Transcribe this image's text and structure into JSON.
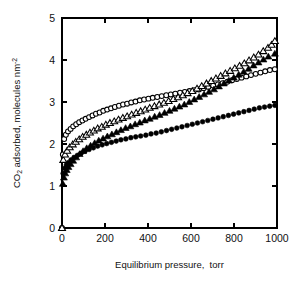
{
  "chart_data": {
    "type": "scatter",
    "title": "",
    "xlabel": "Equilibrium pressure,  torr",
    "ylabel": "CO2 adsorbed, molecules nm-2",
    "ylabel_parts": {
      "prefix": "CO",
      "subscript": "2",
      "middle": " adsorbed, molecules nm",
      "superscript": "-2"
    },
    "xlabel_parts": {
      "main": "Equilibrium pressure,",
      "unit": "torr"
    },
    "xlim": [
      0,
      1000
    ],
    "ylim": [
      0,
      5
    ],
    "xticks": [
      0,
      200,
      400,
      600,
      800,
      1000
    ],
    "yticks": [
      0,
      1,
      2,
      3,
      4,
      5
    ],
    "xtick_labels": [
      "0",
      "200",
      "400",
      "600",
      "800",
      "1000"
    ],
    "ytick_labels": [
      "0",
      "1",
      "2",
      "3",
      "4",
      "5"
    ],
    "grid": false,
    "legend": "none",
    "tick_direction": "in",
    "frame": [
      "left",
      "bottom",
      "top",
      "right"
    ],
    "series": [
      {
        "name": "open-circles",
        "marker": "circle-open",
        "color": "#000000",
        "points": [
          [
            0,
            0
          ],
          [
            4,
            1.75
          ],
          [
            10,
            2.12
          ],
          [
            18,
            2.22
          ],
          [
            28,
            2.3
          ],
          [
            40,
            2.36
          ],
          [
            52,
            2.42
          ],
          [
            66,
            2.47
          ],
          [
            80,
            2.52
          ],
          [
            95,
            2.56
          ],
          [
            110,
            2.6
          ],
          [
            126,
            2.64
          ],
          [
            142,
            2.68
          ],
          [
            158,
            2.72
          ],
          [
            175,
            2.75
          ],
          [
            192,
            2.79
          ],
          [
            210,
            2.82
          ],
          [
            228,
            2.85
          ],
          [
            246,
            2.88
          ],
          [
            265,
            2.91
          ],
          [
            284,
            2.94
          ],
          [
            303,
            2.96
          ],
          [
            322,
            2.99
          ],
          [
            342,
            3.01
          ],
          [
            362,
            3.04
          ],
          [
            382,
            3.06
          ],
          [
            402,
            3.08
          ],
          [
            422,
            3.1
          ],
          [
            443,
            3.12
          ],
          [
            464,
            3.14
          ],
          [
            485,
            3.16
          ],
          [
            506,
            3.18
          ],
          [
            527,
            3.2
          ],
          [
            549,
            3.22
          ],
          [
            571,
            3.24
          ],
          [
            593,
            3.26
          ],
          [
            615,
            3.28
          ],
          [
            637,
            3.3
          ],
          [
            659,
            3.33
          ],
          [
            681,
            3.36
          ],
          [
            703,
            3.39
          ],
          [
            725,
            3.42
          ],
          [
            747,
            3.45
          ],
          [
            769,
            3.48
          ],
          [
            791,
            3.52
          ],
          [
            813,
            3.55
          ],
          [
            835,
            3.58
          ],
          [
            857,
            3.61
          ],
          [
            879,
            3.64
          ],
          [
            901,
            3.67
          ],
          [
            923,
            3.7
          ],
          [
            945,
            3.73
          ],
          [
            967,
            3.76
          ],
          [
            990,
            3.78
          ]
        ]
      },
      {
        "name": "open-triangles",
        "marker": "triangle-open",
        "color": "#000000",
        "points": [
          [
            0,
            0
          ],
          [
            6,
            1.62
          ],
          [
            14,
            1.75
          ],
          [
            24,
            1.84
          ],
          [
            36,
            1.92
          ],
          [
            50,
            1.99
          ],
          [
            64,
            2.05
          ],
          [
            80,
            2.11
          ],
          [
            96,
            2.17
          ],
          [
            113,
            2.22
          ],
          [
            130,
            2.27
          ],
          [
            148,
            2.32
          ],
          [
            166,
            2.37
          ],
          [
            185,
            2.41
          ],
          [
            204,
            2.46
          ],
          [
            223,
            2.5
          ],
          [
            243,
            2.54
          ],
          [
            263,
            2.58
          ],
          [
            283,
            2.62
          ],
          [
            303,
            2.66
          ],
          [
            324,
            2.7
          ],
          [
            345,
            2.74
          ],
          [
            366,
            2.78
          ],
          [
            387,
            2.82
          ],
          [
            408,
            2.86
          ],
          [
            430,
            2.9
          ],
          [
            452,
            2.94
          ],
          [
            474,
            2.98
          ],
          [
            496,
            3.02
          ],
          [
            518,
            3.07
          ],
          [
            540,
            3.11
          ],
          [
            562,
            3.16
          ],
          [
            584,
            3.21
          ],
          [
            606,
            3.26
          ],
          [
            628,
            3.32
          ],
          [
            650,
            3.38
          ],
          [
            672,
            3.44
          ],
          [
            694,
            3.5
          ],
          [
            716,
            3.56
          ],
          [
            738,
            3.62
          ],
          [
            760,
            3.68
          ],
          [
            782,
            3.74
          ],
          [
            804,
            3.8
          ],
          [
            826,
            3.86
          ],
          [
            848,
            3.92
          ],
          [
            870,
            3.99
          ],
          [
            892,
            4.06
          ],
          [
            914,
            4.13
          ],
          [
            936,
            4.21
          ],
          [
            958,
            4.29
          ],
          [
            975,
            4.36
          ],
          [
            990,
            4.45
          ]
        ]
      },
      {
        "name": "filled-triangles",
        "marker": "triangle-filled",
        "color": "#000000",
        "points": [
          [
            0,
            0
          ],
          [
            4,
            1.05
          ],
          [
            9,
            1.2
          ],
          [
            15,
            1.3
          ],
          [
            22,
            1.38
          ],
          [
            30,
            1.45
          ],
          [
            40,
            1.52
          ],
          [
            52,
            1.6
          ],
          [
            66,
            1.68
          ],
          [
            82,
            1.76
          ],
          [
            98,
            1.83
          ],
          [
            115,
            1.9
          ],
          [
            133,
            1.96
          ],
          [
            152,
            2.02
          ],
          [
            171,
            2.08
          ],
          [
            191,
            2.13
          ],
          [
            211,
            2.18
          ],
          [
            232,
            2.23
          ],
          [
            253,
            2.28
          ],
          [
            274,
            2.33
          ],
          [
            296,
            2.38
          ],
          [
            318,
            2.42
          ],
          [
            340,
            2.47
          ],
          [
            362,
            2.51
          ],
          [
            385,
            2.56
          ],
          [
            408,
            2.6
          ],
          [
            431,
            2.65
          ],
          [
            454,
            2.69
          ],
          [
            477,
            2.74
          ],
          [
            500,
            2.79
          ],
          [
            523,
            2.84
          ],
          [
            546,
            2.89
          ],
          [
            569,
            2.94
          ],
          [
            592,
            3.0
          ],
          [
            615,
            3.06
          ],
          [
            638,
            3.12
          ],
          [
            661,
            3.18
          ],
          [
            684,
            3.24
          ],
          [
            707,
            3.3
          ],
          [
            730,
            3.37
          ],
          [
            753,
            3.44
          ],
          [
            776,
            3.51
          ],
          [
            799,
            3.58
          ],
          [
            822,
            3.65
          ],
          [
            845,
            3.72
          ],
          [
            868,
            3.79
          ],
          [
            891,
            3.87
          ],
          [
            914,
            3.94
          ],
          [
            937,
            4.01
          ],
          [
            960,
            4.08
          ],
          [
            990,
            4.15
          ]
        ]
      },
      {
        "name": "filled-circles",
        "marker": "circle-filled",
        "color": "#000000",
        "points": [
          [
            0,
            0
          ],
          [
            5,
            1.3
          ],
          [
            12,
            1.42
          ],
          [
            20,
            1.5
          ],
          [
            30,
            1.56
          ],
          [
            42,
            1.62
          ],
          [
            56,
            1.68
          ],
          [
            72,
            1.73
          ],
          [
            89,
            1.78
          ],
          [
            107,
            1.83
          ],
          [
            126,
            1.87
          ],
          [
            146,
            1.91
          ],
          [
            166,
            1.95
          ],
          [
            187,
            1.98
          ],
          [
            208,
            2.01
          ],
          [
            230,
            2.04
          ],
          [
            252,
            2.07
          ],
          [
            274,
            2.1
          ],
          [
            297,
            2.12
          ],
          [
            320,
            2.15
          ],
          [
            343,
            2.17
          ],
          [
            366,
            2.19
          ],
          [
            390,
            2.21
          ],
          [
            414,
            2.24
          ],
          [
            438,
            2.26
          ],
          [
            462,
            2.29
          ],
          [
            486,
            2.32
          ],
          [
            510,
            2.35
          ],
          [
            534,
            2.38
          ],
          [
            558,
            2.41
          ],
          [
            582,
            2.44
          ],
          [
            606,
            2.47
          ],
          [
            630,
            2.5
          ],
          [
            654,
            2.53
          ],
          [
            678,
            2.56
          ],
          [
            702,
            2.59
          ],
          [
            726,
            2.62
          ],
          [
            750,
            2.65
          ],
          [
            774,
            2.68
          ],
          [
            798,
            2.71
          ],
          [
            822,
            2.74
          ],
          [
            846,
            2.77
          ],
          [
            870,
            2.8
          ],
          [
            894,
            2.83
          ],
          [
            918,
            2.86
          ],
          [
            942,
            2.88
          ],
          [
            966,
            2.9
          ],
          [
            990,
            2.92
          ]
        ]
      }
    ]
  }
}
